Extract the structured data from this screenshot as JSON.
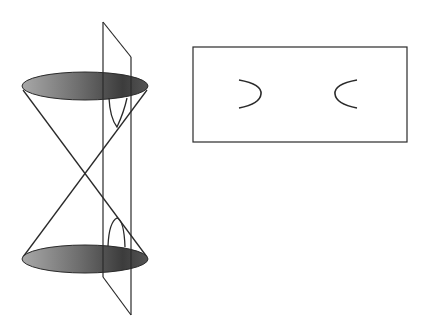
{
  "figure": {
    "colors": {
      "stroke": "#2a2a2a",
      "ellipse_dark": "#3a3a3a",
      "ellipse_light": "#9a9a9a",
      "background": "#ffffff"
    },
    "cone": {
      "apex": [
        85,
        173
      ],
      "top_ellipse": {
        "cx": 85,
        "cy": 86,
        "rx": 63,
        "ry": 14
      },
      "bottom_ellipse": {
        "cx": 85,
        "cy": 259,
        "rx": 63,
        "ry": 14
      }
    },
    "plane": {
      "left_x": 103,
      "right_x": 131
    },
    "section_view": {
      "rect": {
        "x": 193,
        "y": 47,
        "width": 214,
        "height": 95
      },
      "branches": [
        "left-branch",
        "right-branch"
      ]
    }
  }
}
